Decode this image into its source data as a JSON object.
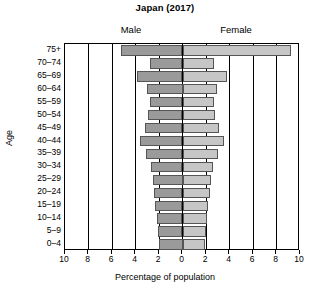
{
  "chart_data": {
    "type": "bar",
    "subtype": "population-pyramid",
    "title": "Japan (2017)",
    "xlabel": "Percentage of population",
    "ylabel": "Age",
    "categories": [
      "0–4",
      "5–9",
      "10–14",
      "15–19",
      "20–24",
      "25–29",
      "30–34",
      "35–39",
      "40–44",
      "45–49",
      "50–54",
      "55–59",
      "60–64",
      "65–69",
      "70–74",
      "75+"
    ],
    "series": [
      {
        "name": "Male",
        "values": [
          2.0,
          2.1,
          2.2,
          2.3,
          2.4,
          2.5,
          2.7,
          3.1,
          3.6,
          3.2,
          2.9,
          2.8,
          3.0,
          3.9,
          2.8,
          5.2
        ]
      },
      {
        "name": "Female",
        "values": [
          1.9,
          2.0,
          2.1,
          2.2,
          2.3,
          2.4,
          2.6,
          3.0,
          3.5,
          3.1,
          2.8,
          2.7,
          2.9,
          3.8,
          2.7,
          9.2
        ]
      }
    ],
    "xticks": [
      {
        "label": "10",
        "value": -10
      },
      {
        "label": "8",
        "value": -8
      },
      {
        "label": "6",
        "value": -6
      },
      {
        "label": "4",
        "value": -4
      },
      {
        "label": "2",
        "value": -2
      },
      {
        "label": "0",
        "value": 0
      },
      {
        "label": "2",
        "value": 2
      },
      {
        "label": "4",
        "value": 4
      },
      {
        "label": "6",
        "value": 6
      },
      {
        "label": "8",
        "value": 8
      },
      {
        "label": "10",
        "value": 10
      }
    ],
    "xlim": [
      -10,
      10
    ],
    "grid": true,
    "legend_position": "above-panel",
    "colors": {
      "male": "#9a9a9a",
      "female": "#c6c6c6",
      "bar_border": "#555555",
      "axis": "#000000",
      "background": "#ffffff"
    }
  },
  "labels": {
    "male_group": "Male",
    "female_group": "Female"
  }
}
